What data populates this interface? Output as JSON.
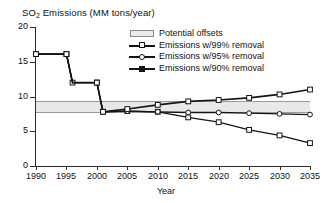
{
  "chart_data": {
    "type": "line",
    "title": "SO2 Emissions (MM tons/year)",
    "title_main": "SO",
    "title_sub": "2",
    "title_rest": " Emissions (MM tons/year)",
    "xlabel": "Year",
    "ylabel": "SO2 Emissions (MM tons/year)",
    "xlim": [
      1990,
      2035
    ],
    "ylim": [
      0,
      20
    ],
    "xticks": [
      1990,
      1995,
      2000,
      2005,
      2010,
      2015,
      2020,
      2025,
      2030,
      2035
    ],
    "yticks": [
      0,
      5,
      10,
      15,
      20
    ],
    "grid": false,
    "legend_position": "top-center-right",
    "band": {
      "label": "Potential offsets",
      "y_low": 7.65,
      "y_high": 9.35,
      "x_start": 1990,
      "x_end": 2035,
      "color": "#e8e8e8",
      "edge_color": "#9a9a9a"
    },
    "series": [
      {
        "name": "Emissions w/99% removal",
        "marker": "square-open",
        "color": "#141414",
        "x": [
          1990,
          1995,
          1996,
          2000,
          2001,
          2005,
          2010,
          2015,
          2020,
          2025,
          2030,
          2035
        ],
        "values": [
          16.1,
          16.1,
          12.0,
          12.0,
          7.8,
          7.9,
          7.8,
          7.0,
          6.3,
          5.2,
          4.4,
          3.3
        ]
      },
      {
        "name": "Emissions w/95% removal",
        "marker": "circle-open",
        "color": "#141414",
        "x": [
          1990,
          1995,
          1996,
          2000,
          2001,
          2005,
          2010,
          2015,
          2020,
          2025,
          2030,
          2035
        ],
        "values": [
          16.1,
          16.1,
          12.0,
          12.0,
          7.8,
          7.9,
          7.8,
          7.7,
          7.7,
          7.6,
          7.5,
          7.4
        ]
      },
      {
        "name": "Emissions w/90% removal",
        "marker": "triangle-open",
        "color": "#141414",
        "x": [
          1990,
          1995,
          1996,
          2000,
          2001,
          2005,
          2010,
          2015,
          2020,
          2025,
          2030,
          2035
        ],
        "values": [
          16.1,
          16.1,
          12.0,
          12.0,
          7.8,
          8.2,
          8.8,
          9.3,
          9.5,
          9.8,
          10.3,
          11.0
        ]
      }
    ],
    "legend": [
      {
        "label": "Potential offsets",
        "key": "band"
      },
      {
        "label": "Emissions w/99% removal",
        "key": "line-open-square"
      },
      {
        "label": "Emissions w/95% removal",
        "key": "line-open-circle"
      },
      {
        "label": "Emissions w/90% removal",
        "key": "line-filled"
      }
    ]
  },
  "axis": {
    "y_tick_labels": [
      "20",
      "15",
      "10",
      "5",
      "0"
    ],
    "x_tick_labels": [
      "1990",
      "1995",
      "2000",
      "2005",
      "2010",
      "2015",
      "2020",
      "2025",
      "2030",
      "2035"
    ],
    "x_title": "Year"
  }
}
